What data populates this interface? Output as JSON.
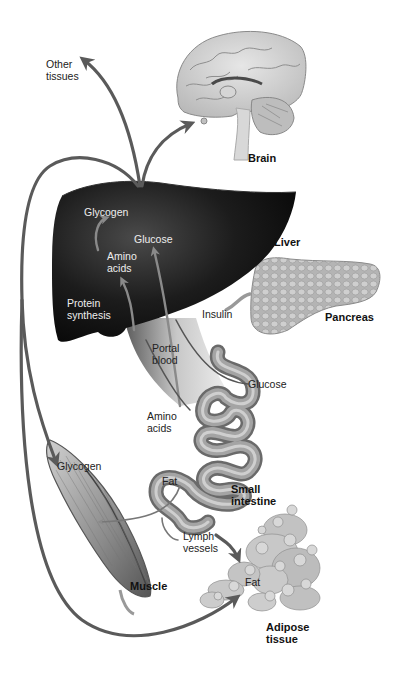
{
  "diagram": {
    "type": "nutrient-flow",
    "arrow_color": "#5a5a5a",
    "organs": [
      {
        "id": "brain",
        "label": "Brain"
      },
      {
        "id": "liver",
        "label": "Liver"
      },
      {
        "id": "pancreas",
        "label": "Pancreas"
      },
      {
        "id": "small_intestine",
        "label": "Small\nintestine"
      },
      {
        "id": "muscle",
        "label": "Muscle"
      },
      {
        "id": "adipose",
        "label": "Adipose\ntissue"
      }
    ],
    "labels": {
      "other_tissues": "Other\ntissues",
      "liver_glycogen": "Glycogen",
      "liver_glucose": "Glucose",
      "liver_amino_acids": "Amino\nacids",
      "protein_synthesis": "Protein\nsynthesis",
      "insulin": "Insulin",
      "portal_blood": "Portal\nblood",
      "intestine_glucose": "Glucose",
      "intestine_amino_acids": "Amino\nacids",
      "intestine_fat": "Fat",
      "muscle_glycogen": "Glycogen",
      "lymph_vessels": "Lymph\nvessels",
      "adipose_fat": "Fat"
    },
    "flows": [
      {
        "from": "liver",
        "to": "other_tissues",
        "substance": "Glucose"
      },
      {
        "from": "liver",
        "to": "brain",
        "substance": "Glucose"
      },
      {
        "from": "liver",
        "to": "muscle",
        "substance": "Glucose"
      },
      {
        "from": "liver",
        "to": "adipose",
        "substance": "Glucose"
      },
      {
        "from": "small_intestine",
        "to": "liver",
        "substance": "Glucose",
        "via": "Portal blood"
      },
      {
        "from": "small_intestine",
        "to": "liver",
        "substance": "Amino acids",
        "via": "Portal blood"
      },
      {
        "from": "pancreas",
        "to": "liver",
        "substance": "Insulin"
      },
      {
        "from": "small_intestine",
        "to": "adipose",
        "substance": "Fat",
        "via": "Lymph vessels"
      },
      {
        "from": "small_intestine",
        "to": "muscle",
        "substance": "Fat"
      }
    ]
  }
}
